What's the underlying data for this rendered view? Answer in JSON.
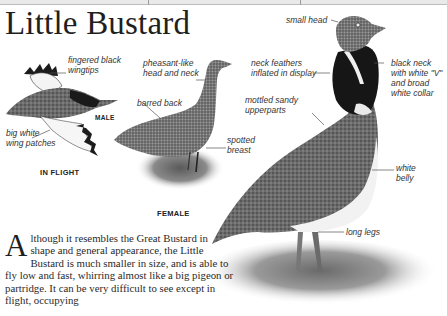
{
  "page": {
    "title": "Little Bustard"
  },
  "illustrations": {
    "flight": {
      "caption": "IN FLIGHT",
      "sex_label": "MALE",
      "labels": {
        "wingtips": "fingered black\nwingtips",
        "wing_patches": "big white\nwing patches"
      }
    },
    "female": {
      "caption": "FEMALE",
      "labels": {
        "head_neck": "pheasant-like\nhead and neck",
        "back": "barred back",
        "breast": "spotted\nbreast"
      }
    },
    "male": {
      "labels": {
        "head": "small head",
        "neck_feathers": "neck feathers\ninflated in display",
        "black_neck": "black neck\nwith white \"V\"\nand broad\nwhite collar",
        "upperparts": "mottled sandy\nupperparts",
        "belly": "white\nbelly",
        "legs": "long legs"
      }
    }
  },
  "body": {
    "dropcap": "A",
    "text": "lthough it resembles the Great Bustard in shape and general appearance, the Little Bustard is much smaller in size, and is able to fly low and fast, whirring almost like a big pigeon or partridge. It can be very difficult to see except in flight, occupying"
  }
}
